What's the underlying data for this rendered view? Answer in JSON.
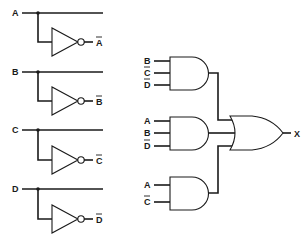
{
  "diagram": {
    "type": "logic-circuit",
    "inverters": [
      {
        "input": "A",
        "output": "A",
        "output_negated": true
      },
      {
        "input": "B",
        "output": "B",
        "output_negated": true
      },
      {
        "input": "C",
        "output": "C",
        "output_negated": true
      },
      {
        "input": "D",
        "output": "D",
        "output_negated": true
      }
    ],
    "and_gates": [
      {
        "inputs": [
          {
            "name": "B",
            "negated": false
          },
          {
            "name": "C",
            "negated": true
          },
          {
            "name": "D",
            "negated": true
          }
        ]
      },
      {
        "inputs": [
          {
            "name": "A",
            "negated": false
          },
          {
            "name": "B",
            "negated": false
          },
          {
            "name": "D",
            "negated": true
          }
        ]
      },
      {
        "inputs": [
          {
            "name": "A",
            "negated": false
          },
          {
            "name": "C",
            "negated": true
          }
        ]
      }
    ],
    "or_gate": {
      "inputs": 3,
      "output": "X"
    },
    "colors": {
      "line": "#1a1a1a",
      "background": "#ffffff"
    }
  }
}
